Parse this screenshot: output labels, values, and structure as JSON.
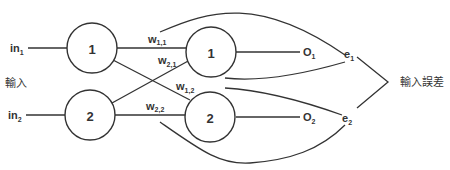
{
  "diagram": {
    "inputs": [
      {
        "base": "in",
        "sub": "1"
      },
      {
        "base": "in",
        "sub": "2"
      }
    ],
    "input_group_label": "輸入",
    "hidden_nodes": [
      "1",
      "2"
    ],
    "output_nodes": [
      "1",
      "2"
    ],
    "weights": [
      {
        "base": "w",
        "sub": "1,1"
      },
      {
        "base": "w",
        "sub": "2,1"
      },
      {
        "base": "w",
        "sub": "1,2"
      },
      {
        "base": "w",
        "sub": "2,2"
      }
    ],
    "outputs": [
      {
        "base": "O",
        "sub": "1"
      },
      {
        "base": "O",
        "sub": "2"
      }
    ],
    "errors": [
      {
        "base": "e",
        "sub": "1"
      },
      {
        "base": "e",
        "sub": "2"
      }
    ],
    "error_group_label": "輸入誤差"
  }
}
